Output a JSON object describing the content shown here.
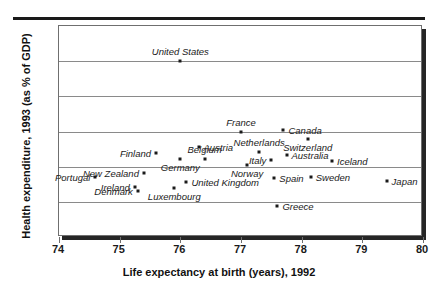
{
  "chart_data": {
    "type": "scatter",
    "title": "",
    "xlabel": "Life expectancy at birth (years), 1992",
    "ylabel": "Health expenditure, 1993 (as % of GDP)",
    "xlim": [
      74,
      80
    ],
    "ylim": [
      4,
      16
    ],
    "xticks": [
      74,
      75,
      76,
      77,
      78,
      79,
      80
    ],
    "yticks": [
      4,
      6,
      8,
      10,
      12,
      14,
      16
    ],
    "grid": "horizontal",
    "legend": "none",
    "points": [
      {
        "label": "United States",
        "x": 76.0,
        "y": 14.0,
        "lpos": "above"
      },
      {
        "label": "France",
        "x": 77.0,
        "y": 10.0,
        "lpos": "above"
      },
      {
        "label": "Canada",
        "x": 77.7,
        "y": 10.1,
        "lpos": "right"
      },
      {
        "label": "Switzerland",
        "x": 78.1,
        "y": 9.55,
        "lpos": "below"
      },
      {
        "label": "Austria",
        "x": 76.3,
        "y": 9.1,
        "lpos": "right"
      },
      {
        "label": "Netherlands",
        "x": 77.3,
        "y": 8.85,
        "lpos": "above"
      },
      {
        "label": "Finland",
        "x": 75.6,
        "y": 8.8,
        "lpos": "left"
      },
      {
        "label": "Belgium",
        "x": 76.4,
        "y": 8.45,
        "lpos": "above"
      },
      {
        "label": "Germany",
        "x": 76.0,
        "y": 8.45,
        "lpos": "below"
      },
      {
        "label": "Australia",
        "x": 77.75,
        "y": 8.65,
        "lpos": "right"
      },
      {
        "label": "Italy",
        "x": 77.5,
        "y": 8.4,
        "lpos": "left"
      },
      {
        "label": "Iceland",
        "x": 78.5,
        "y": 8.35,
        "lpos": "right"
      },
      {
        "label": "Norway",
        "x": 77.1,
        "y": 8.1,
        "lpos": "below"
      },
      {
        "label": "New Zealand",
        "x": 75.4,
        "y": 7.65,
        "lpos": "left"
      },
      {
        "label": "Portugal",
        "x": 74.6,
        "y": 7.4,
        "lpos": "left"
      },
      {
        "label": "Sweden",
        "x": 78.15,
        "y": 7.4,
        "lpos": "right"
      },
      {
        "label": "Spain",
        "x": 77.55,
        "y": 7.35,
        "lpos": "right"
      },
      {
        "label": "Japan",
        "x": 79.4,
        "y": 7.2,
        "lpos": "right"
      },
      {
        "label": "United Kingdom",
        "x": 76.1,
        "y": 7.15,
        "lpos": "right"
      },
      {
        "label": "Ireland",
        "x": 75.25,
        "y": 6.85,
        "lpos": "left"
      },
      {
        "label": "Luxembourg",
        "x": 75.9,
        "y": 6.8,
        "lpos": "below"
      },
      {
        "label": "Denmark",
        "x": 75.3,
        "y": 6.6,
        "lpos": "left"
      },
      {
        "label": "Greece",
        "x": 77.6,
        "y": 5.75,
        "lpos": "right"
      }
    ]
  }
}
